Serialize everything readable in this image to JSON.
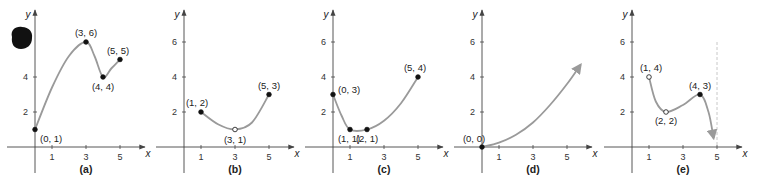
{
  "chart_data": [
    {
      "type": "line",
      "panel": "(a)",
      "xlabel": "x",
      "ylabel": "y",
      "xticks": [
        1,
        3,
        5
      ],
      "yticks": [
        2,
        4
      ],
      "xlim": [
        -1.5,
        6.3
      ],
      "ylim": [
        -1.5,
        7.5
      ],
      "points": [
        {
          "x": 0,
          "y": 1,
          "label": "(0, 1)",
          "filled": true
        },
        {
          "x": 3,
          "y": 6,
          "label": "(3, 6)",
          "filled": true
        },
        {
          "x": 4,
          "y": 4,
          "label": "(4, 4)",
          "filled": true
        },
        {
          "x": 5,
          "y": 5,
          "label": "(5, 5)",
          "filled": true
        }
      ],
      "curve": [
        [
          0,
          1
        ],
        [
          1,
          3.4
        ],
        [
          2,
          5.2
        ],
        [
          3,
          6
        ],
        [
          3.5,
          5.2
        ],
        [
          4,
          4
        ],
        [
          4.5,
          4.5
        ],
        [
          5,
          5
        ]
      ],
      "arrow_end": false
    },
    {
      "type": "line",
      "panel": "(b)",
      "xlabel": "x",
      "ylabel": "y",
      "xticks": [
        1,
        3,
        5
      ],
      "yticks": [
        2,
        4,
        6
      ],
      "points": [
        {
          "x": 1,
          "y": 2,
          "label": "(1, 2)",
          "filled": true
        },
        {
          "x": 3,
          "y": 1,
          "label": "(3, 1)",
          "filled": false
        },
        {
          "x": 5,
          "y": 3,
          "label": "(5, 3)",
          "filled": true
        }
      ],
      "curve": [
        [
          1,
          2
        ],
        [
          2,
          1.3
        ],
        [
          3,
          1
        ],
        [
          4,
          1.4
        ],
        [
          5,
          3
        ]
      ],
      "arrow_end": false
    },
    {
      "type": "line",
      "panel": "(c)",
      "xlabel": "x",
      "ylabel": "y",
      "xticks": [
        1,
        3,
        5
      ],
      "yticks": [
        2,
        4,
        6
      ],
      "points": [
        {
          "x": 0,
          "y": 3,
          "label": "(0, 3)",
          "filled": true
        },
        {
          "x": 1,
          "y": 1,
          "label": "(1, 1)",
          "filled": true
        },
        {
          "x": 2,
          "y": 1,
          "label": "(2, 1)",
          "filled": true
        },
        {
          "x": 5,
          "y": 4,
          "label": "(5, 4)",
          "filled": true
        }
      ],
      "curve": [
        [
          0,
          3
        ],
        [
          0.5,
          1.8
        ],
        [
          1,
          1
        ],
        [
          2,
          1
        ],
        [
          3,
          1.5
        ],
        [
          4,
          2.5
        ],
        [
          5,
          4
        ]
      ],
      "arrow_end": false
    },
    {
      "type": "line",
      "panel": "(d)",
      "xlabel": "x",
      "ylabel": "y",
      "xticks": [
        1,
        3,
        5
      ],
      "yticks": [
        2,
        4,
        6
      ],
      "points": [
        {
          "x": 0,
          "y": 0,
          "label": "(0, 0)",
          "filled": true
        }
      ],
      "curve": [
        [
          0,
          0
        ],
        [
          1,
          0.25
        ],
        [
          2,
          0.7
        ],
        [
          3,
          1.4
        ],
        [
          4,
          2.4
        ],
        [
          5,
          3.6
        ],
        [
          5.8,
          4.7
        ]
      ],
      "arrow_end": true
    },
    {
      "type": "line",
      "panel": "(e)",
      "xlabel": "x",
      "ylabel": "y",
      "xticks": [
        1,
        3,
        5
      ],
      "yticks": [
        2,
        4,
        6
      ],
      "asymptote_x": 5,
      "points": [
        {
          "x": 1,
          "y": 4,
          "label": "(1, 4)",
          "filled": false
        },
        {
          "x": 2,
          "y": 2,
          "label": "(2, 2)",
          "filled": false
        },
        {
          "x": 4,
          "y": 3,
          "label": "(4, 3)",
          "filled": true
        }
      ],
      "curve": [
        [
          1,
          4
        ],
        [
          1.4,
          2.6
        ],
        [
          2,
          2
        ],
        [
          3,
          2.4
        ],
        [
          4,
          3
        ],
        [
          4.5,
          2
        ],
        [
          4.8,
          0.5
        ]
      ],
      "arrow_end": true
    }
  ],
  "decorations": {
    "blob": {
      "panel": "(a)",
      "description": "black filled blob near top-left"
    }
  },
  "colors": {
    "curve": "#9a9a9a",
    "axis": "#444444",
    "point": "#111111",
    "asymptote": "#c8c8c8"
  }
}
